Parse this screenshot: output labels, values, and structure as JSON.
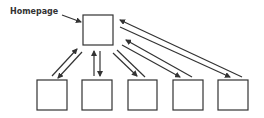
{
  "diagram": {
    "title_label": "Homepage",
    "colors": {
      "stroke": "#333333",
      "background": "#ffffff"
    },
    "nodes": [
      {
        "id": "homepage",
        "label": "Homepage"
      },
      {
        "id": "page-1"
      },
      {
        "id": "page-2"
      },
      {
        "id": "page-3"
      },
      {
        "id": "page-4"
      },
      {
        "id": "page-5"
      }
    ],
    "edges": [
      {
        "from": "homepage",
        "to": "page-1",
        "bidirectional": true
      },
      {
        "from": "homepage",
        "to": "page-2",
        "bidirectional": true
      },
      {
        "from": "homepage",
        "to": "page-3",
        "bidirectional": true
      },
      {
        "from": "homepage",
        "to": "page-4",
        "bidirectional": true
      },
      {
        "from": "homepage",
        "to": "page-5",
        "bidirectional": true
      }
    ]
  }
}
